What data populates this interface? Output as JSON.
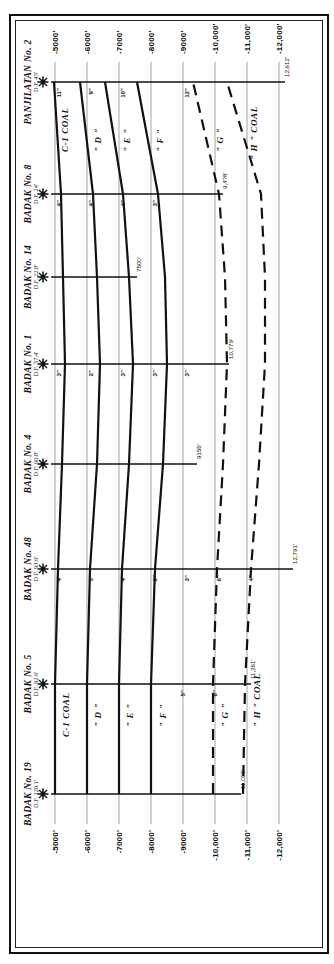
{
  "figure": {
    "kind": "geologic-well-correlation-cross-section",
    "orientation_note": "plate printed sideways; labels read bottom-to-top",
    "depth_axis": {
      "label_suffix": "'",
      "ticks": [
        "-5000'",
        "-6000'",
        "-7000'",
        "-8000'",
        "-9000'",
        "-10,000'",
        "-11,000'",
        "-12,000'"
      ],
      "values": [
        -5000,
        -6000,
        -7000,
        -8000,
        -9000,
        -10000,
        -11000,
        -12000
      ]
    },
    "wells": [
      {
        "name": "BADAK No. 19",
        "datum": "D.F. 120.1'"
      },
      {
        "name": "BADAK No. 5",
        "datum": "D.F. 92.6'"
      },
      {
        "name": "BADAK No. 48",
        "datum": "D.F. 93.6'"
      },
      {
        "name": "BADAK No. 4",
        "datum": "D.F. 60.8'"
      },
      {
        "name": "BADAK No. 1",
        "datum": "D.F. 57.4'"
      },
      {
        "name": "BADAK No. 14",
        "datum": "D.F. 22.8'"
      },
      {
        "name": "BADAK No. 8",
        "datum": "D.F. 24'"
      },
      {
        "name": "PANJILATAN No. 2",
        "datum": "D.F. 45'"
      }
    ],
    "seams": [
      {
        "id": "C1",
        "label": "C-1  COAL",
        "style": "solid"
      },
      {
        "id": "D",
        "label": "\" D \"",
        "style": "solid"
      },
      {
        "id": "E",
        "label": "\" E \"",
        "style": "solid"
      },
      {
        "id": "F",
        "label": "\" F \"",
        "style": "solid"
      },
      {
        "id": "G",
        "label": "\" G \"",
        "style": "dashed"
      },
      {
        "id": "H",
        "label": "\" H \" COAL",
        "style": "dashed"
      }
    ],
    "thickness_labels": {
      "badak48": [
        "4\"",
        "5\"",
        "4\"",
        "6\"",
        "3\"",
        "6\"",
        "4\""
      ],
      "badak1": [
        "3\"",
        "2\"",
        "3\"",
        "3\"",
        "3\""
      ],
      "badak8": [
        "4\"",
        "4\"",
        "4\"",
        "3\""
      ],
      "panjilatan": [
        "11\"",
        "9\"",
        "10\"",
        "12\""
      ],
      "badak5": [
        "5\"",
        "6\""
      ]
    },
    "total_depths": [
      {
        "well": "BADAK No. 19",
        "value": "11,005'"
      },
      {
        "well": "BADAK No. 48",
        "value": "12,791'"
      },
      {
        "well": "BADAK No. 5",
        "value": "11,261'"
      },
      {
        "well": "BADAK No. 4",
        "value": "9155'"
      },
      {
        "well": "BADAK No. 1",
        "value": "10,779'"
      },
      {
        "well": "BADAK No. 14",
        "value": "7500'"
      },
      {
        "well": "BADAK No. 8",
        "value": "9,4?8'"
      },
      {
        "well": "PANJILATAN No. 2",
        "value": "12,612'"
      }
    ],
    "well_symbol": "derrick-star-symbol"
  }
}
